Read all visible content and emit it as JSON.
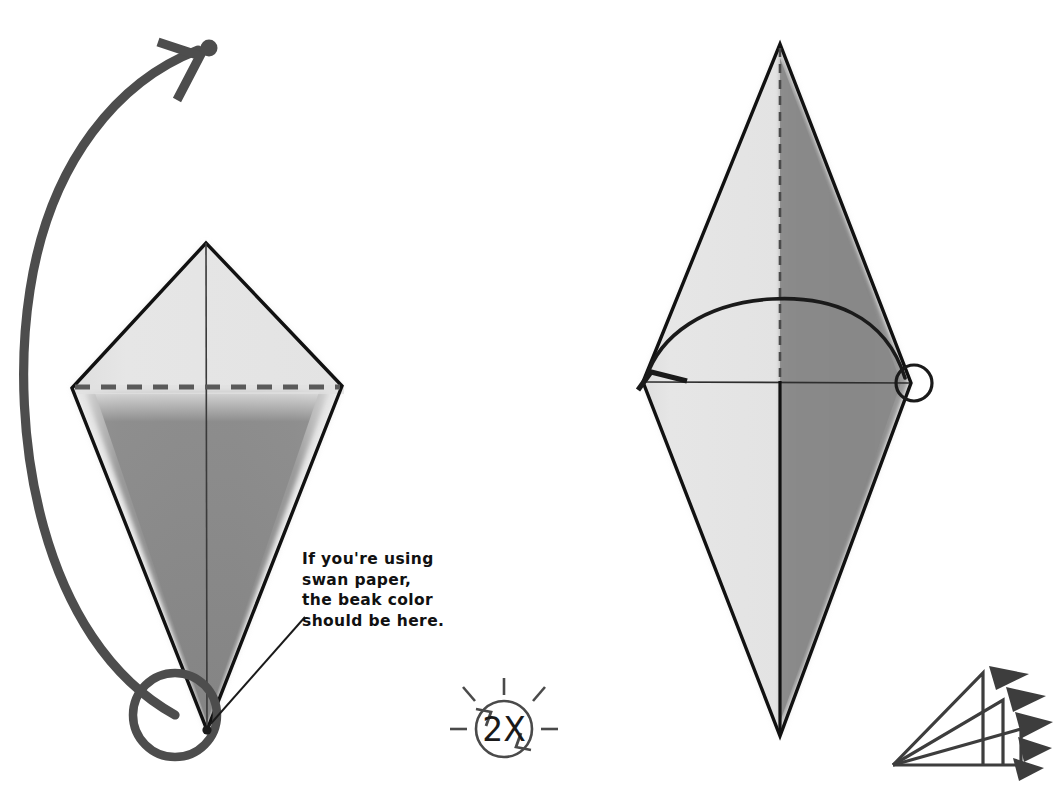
{
  "page": {
    "background_color": "#ffffff",
    "width": 1062,
    "height": 791
  },
  "annotation": {
    "note_text": "If you're using\nswan paper,\nthe beak color\nshould be here.",
    "note_lines": [
      "If you're using",
      "swan paper,",
      "the beak color",
      "should be here."
    ]
  },
  "symbols": {
    "repeat_label": "2X",
    "repeat_symbol_name": "turn-over-twice-symbol",
    "fanfold_symbol_name": "repeat-fold-layers-icon"
  },
  "colors": {
    "paper_light": "#e4e4e4",
    "paper_dark": "#8b8b8b",
    "outline": "#111111",
    "arrow": "#4d4d4d",
    "text": "#111111",
    "white": "#ffffff"
  },
  "left_figure": {
    "name": "kite-base-before-fold",
    "apex_top": [
      206,
      243
    ],
    "vertex_left": [
      72,
      388
    ],
    "vertex_right": [
      342,
      386
    ],
    "apex_bottom": [
      207,
      730
    ],
    "fold_line_style": "dashed",
    "fold_line_y": 387,
    "center_line_style": "solid",
    "highlight_circle": {
      "cx": 175,
      "cy": 715,
      "r": 42
    },
    "tip_dot": [
      207,
      730
    ]
  },
  "right_figure": {
    "name": "kite-base-after-fold",
    "apex_top": [
      780,
      44
    ],
    "vertex_left": [
      643,
      382
    ],
    "vertex_right": [
      911,
      383
    ],
    "apex_bottom": [
      780,
      736
    ],
    "center_line_top_style": "dashed",
    "center_line_bottom_style": "solid",
    "marker_circle": {
      "cx": 914,
      "cy": 383,
      "r": 18
    },
    "arc_arrow": "right-vertex-to-left-vertex"
  },
  "arrows": {
    "big_curve": {
      "name": "valley-fold-rotation-arrow",
      "from": [
        175,
        715
      ],
      "to": [
        210,
        48
      ],
      "stroke_width": 9
    },
    "arrow_tip_dot": [
      209,
      48
    ]
  }
}
